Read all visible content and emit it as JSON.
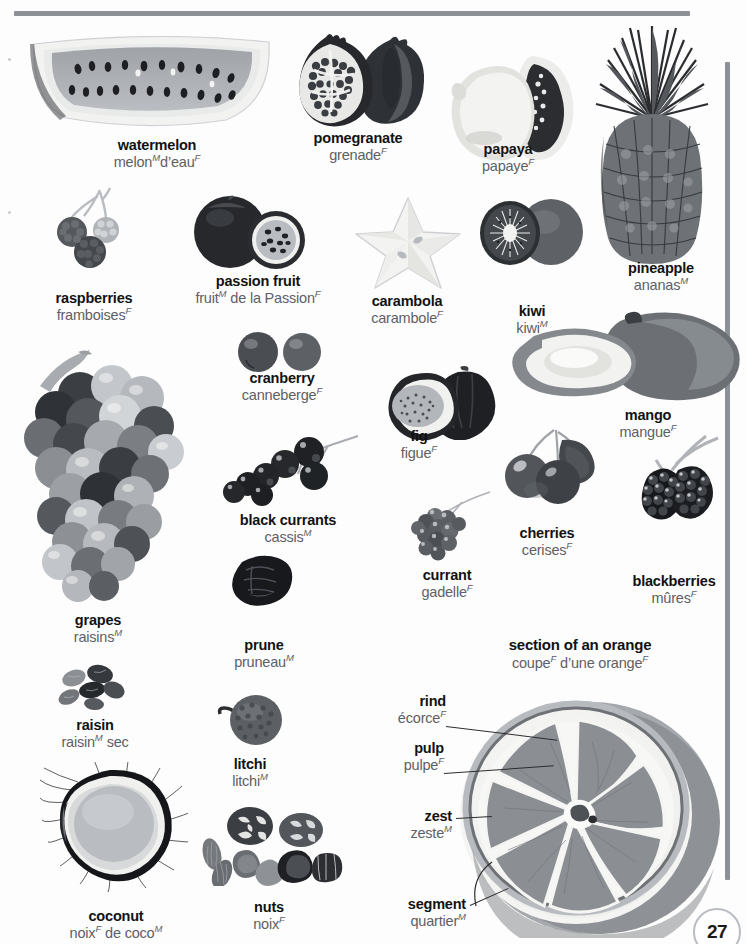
{
  "page": {
    "number": "27",
    "top_rule_color": "#8d9097",
    "right_rule_color": "#8d9097",
    "background": "#ffffff",
    "term_color": "#111213",
    "translation_color": "#5d6066"
  },
  "section": {
    "title_en": "section of an orange",
    "title_fr": "coupe",
    "title_fr_gender_1": "F",
    "title_fr_rest": " d’une orange",
    "title_fr_gender_2": "F"
  },
  "entries": [
    {
      "id": "watermelon",
      "en": "watermelon",
      "fr": "melon",
      "g1": "M",
      "fr2": "d’eau",
      "g2": "F"
    },
    {
      "id": "pomegranate",
      "en": "pomegranate",
      "fr": "grenade",
      "g1": "F",
      "fr2": "",
      "g2": ""
    },
    {
      "id": "papaya",
      "en": "papaya",
      "fr": "papaye",
      "g1": "F",
      "fr2": "",
      "g2": ""
    },
    {
      "id": "pineapple",
      "en": "pineapple",
      "fr": "ananas",
      "g1": "M",
      "fr2": "",
      "g2": ""
    },
    {
      "id": "raspberries",
      "en": "raspberries",
      "fr": "framboises",
      "g1": "F",
      "fr2": "",
      "g2": ""
    },
    {
      "id": "passion-fruit",
      "en": "passion fruit",
      "fr": "fruit",
      "g1": "M",
      "fr2": "de la Passion",
      "g2": "F"
    },
    {
      "id": "carambola",
      "en": "carambola",
      "fr": "carambole",
      "g1": "F",
      "fr2": "",
      "g2": ""
    },
    {
      "id": "kiwi",
      "en": "kiwi",
      "fr": "kiwi",
      "g1": "M",
      "fr2": "",
      "g2": ""
    },
    {
      "id": "cranberry",
      "en": "cranberry",
      "fr": "canneberge",
      "g1": "F",
      "fr2": "",
      "g2": ""
    },
    {
      "id": "fig",
      "en": "fig",
      "fr": "figue",
      "g1": "F",
      "fr2": "",
      "g2": ""
    },
    {
      "id": "mango",
      "en": "mango",
      "fr": "mangue",
      "g1": "F",
      "fr2": "",
      "g2": ""
    },
    {
      "id": "black-currants",
      "en": "black currants",
      "fr": "cassis",
      "g1": "M",
      "fr2": "",
      "g2": ""
    },
    {
      "id": "currant",
      "en": "currant",
      "fr": "gadelle",
      "g1": "F",
      "fr2": "",
      "g2": ""
    },
    {
      "id": "cherries",
      "en": "cherries",
      "fr": "cerises",
      "g1": "F",
      "fr2": "",
      "g2": ""
    },
    {
      "id": "blackberries",
      "en": "blackberries",
      "fr": "mûres",
      "g1": "F",
      "fr2": "",
      "g2": ""
    },
    {
      "id": "grapes",
      "en": "grapes",
      "fr": "raisins",
      "g1": "M",
      "fr2": "",
      "g2": ""
    },
    {
      "id": "prune",
      "en": "prune",
      "fr": "pruneau",
      "g1": "M",
      "fr2": "",
      "g2": ""
    },
    {
      "id": "raisin",
      "en": "raisin",
      "fr": "raisin",
      "g1": "M",
      "fr2": "sec",
      "g2": ""
    },
    {
      "id": "litchi",
      "en": "litchi",
      "fr": "litchi",
      "g1": "M",
      "fr2": "",
      "g2": ""
    },
    {
      "id": "coconut",
      "en": "coconut",
      "fr": "noix",
      "g1": "F",
      "fr2": "de coco",
      "g2": "M"
    },
    {
      "id": "nuts",
      "en": "nuts",
      "fr": "noix",
      "g1": "F",
      "fr2": "",
      "g2": ""
    },
    {
      "id": "rind",
      "en": "rind",
      "fr": "écorce",
      "g1": "F",
      "fr2": "",
      "g2": ""
    },
    {
      "id": "pulp",
      "en": "pulp",
      "fr": "pulpe",
      "g1": "F",
      "fr2": "",
      "g2": ""
    },
    {
      "id": "zest",
      "en": "zest",
      "fr": "zeste",
      "g1": "M",
      "fr2": "",
      "g2": ""
    },
    {
      "id": "segment",
      "en": "segment",
      "fr": "quartier",
      "g1": "M",
      "fr2": "",
      "g2": ""
    }
  ]
}
